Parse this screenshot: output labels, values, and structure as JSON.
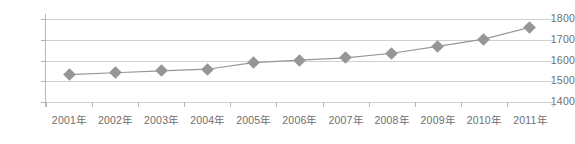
{
  "chart_data": {
    "type": "line",
    "title": "",
    "subtitle": "",
    "xlabel": "",
    "ylabel": "",
    "categories": [
      "2001年",
      "2002年",
      "2003年",
      "2004年",
      "2005年",
      "2006年",
      "2007年",
      "2008年",
      "2009年",
      "2010年",
      "2011年"
    ],
    "values": [
      1532,
      1541,
      1550,
      1558,
      1590,
      1602,
      1613,
      1635,
      1668,
      1703,
      1760
    ],
    "series": [
      {
        "name": "",
        "values": [
          1532,
          1541,
          1550,
          1558,
          1590,
          1602,
          1613,
          1635,
          1668,
          1703,
          1760
        ]
      }
    ],
    "ylim": [
      1400,
      1800
    ],
    "yticks": [
      1400,
      1500,
      1600,
      1700,
      1800
    ],
    "ytick_labels": [
      "1400",
      "1500",
      "1600",
      "1700",
      "1800"
    ],
    "grid": true,
    "grid_axis": "y",
    "legend": false,
    "legend_position": "none",
    "marker": "diamond",
    "colors": {
      "line": "#969696",
      "marker": "#969696",
      "gridline": "#d0d0d0",
      "axis": "#b0b0b0",
      "text": "#6e6e6e",
      "background": "#ffffff"
    }
  }
}
